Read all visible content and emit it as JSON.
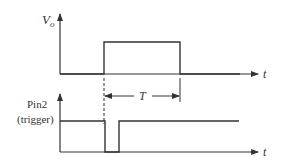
{
  "diagram": {
    "type": "timing-diagram",
    "colors": {
      "line": "#333333",
      "background": "#ffffff"
    },
    "top_plot": {
      "y_label_main": "V",
      "y_label_sub": "o",
      "x_label": "t",
      "signal": "output pulse"
    },
    "bottom_plot": {
      "y_label_line1": "Pin2",
      "y_label_line2": "(trigger)",
      "x_label": "t",
      "signal": "trigger input (negative-going pulse)"
    },
    "annotation": {
      "period_label": "T"
    }
  }
}
